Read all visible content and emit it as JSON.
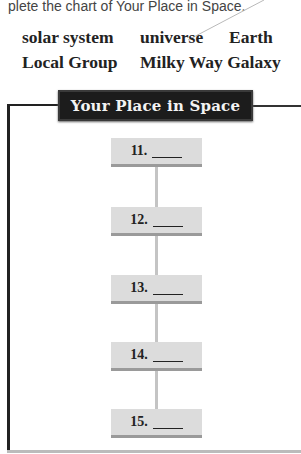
{
  "instructions": "plete the chart of Your Place in Space.",
  "word_bank": [
    {
      "text": "solar system",
      "x": 22,
      "y": 29
    },
    {
      "text": "universe",
      "x": 140,
      "y": 29
    },
    {
      "text": "Earth",
      "x": 229,
      "y": 29
    },
    {
      "text": "Local Group",
      "x": 22,
      "y": 54
    },
    {
      "text": "Milky Way Galaxy",
      "x": 140,
      "y": 54
    }
  ],
  "chart": {
    "title": "Your Place in Space",
    "items": [
      {
        "number": "11.",
        "answer": ""
      },
      {
        "number": "12.",
        "answer": ""
      },
      {
        "number": "13.",
        "answer": ""
      },
      {
        "number": "14.",
        "answer": ""
      },
      {
        "number": "15.",
        "answer": ""
      }
    ]
  },
  "colors": {
    "title_bg": "#1c1c1c",
    "node_bg": "#dcdcdc",
    "node_bar": "#9a9a9a",
    "connector": "#c4c4c4"
  }
}
